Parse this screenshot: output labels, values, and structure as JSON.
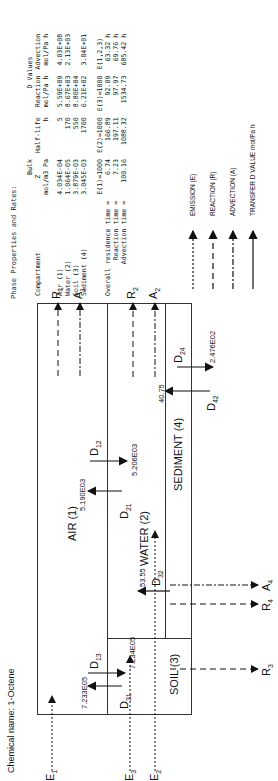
{
  "chemical_name_label": "Chemical name:",
  "chemical_name": "1-Octene",
  "table": {
    "title": "Phase Properties and Rates:",
    "header_row1": [
      "",
      "Bulk",
      "",
      "D Values",
      ""
    ],
    "header_row2": [
      "Compartment",
      "Z",
      "Half-life",
      "Reaction",
      "Advection"
    ],
    "header_row3": [
      "",
      "mol/m3 Pa",
      "h",
      "mol/Pa h",
      "mol/Pa h"
    ],
    "rows": [
      {
        "compartment": "Air (1)",
        "z": "4.034E-04",
        "half_life": "5",
        "reaction": "5.59E+09",
        "advection": "4.03E+08"
      },
      {
        "compartment": "Water (2)",
        "z": "1.064E-05",
        "half_life": "170",
        "reaction": "8.67E+03",
        "advection": "2.13E+03"
      },
      {
        "compartment": "Soil (3)",
        "z": "3.879E-03",
        "half_life": "550",
        "reaction": "8.80E+04",
        "advection": ""
      },
      {
        "compartment": "Sediment (4)",
        "z": "3.045E-03",
        "half_life": "1700",
        "reaction": "6.21E+02",
        "advection": "3.04E+01"
      }
    ],
    "residence_header": [
      "",
      "E(1)=1000",
      "E(2)=1000",
      "E(3)=1000",
      "E(1,2,3)"
    ],
    "residence_rows": [
      {
        "label": "Overall residence time =",
        "e1": "6.74",
        "e2": "166.89",
        "e3": "92.09",
        "e123": "63.32 h"
      },
      {
        "label": "Reaction time =",
        "e1": "7.23",
        "e2": "197.11",
        "e3": "97.97",
        "e123": "69.76 h"
      },
      {
        "label": "Advection time =",
        "e1": "100.16",
        "e2": "1088.32",
        "e3": "1534.73",
        "e123": "685.42 h"
      }
    ]
  },
  "legend": [
    {
      "label": "EMISSION (E)",
      "style": "dotted"
    },
    {
      "label": "REACTION (R)",
      "style": "dashed"
    },
    {
      "label": "ADVECTION (A)",
      "style": "dashdot"
    },
    {
      "label": "TRANSFER D VALUE mol/Pa h",
      "style": "solid"
    }
  ],
  "diagram": {
    "compartments": {
      "air": "AIR (1)",
      "water": "WATER (2)",
      "soil": "SOIL (3)",
      "sediment": "SEDIMENT (4)"
    },
    "emissions": {
      "e1": "E",
      "e1_sub": "1",
      "e2": "E",
      "e2_sub": "2",
      "e3": "E",
      "e3_sub": "3"
    },
    "reactions": {
      "r1": "R",
      "r1_sub": "1",
      "r2": "R",
      "r2_sub": "2",
      "r3": "R",
      "r3_sub": "3",
      "r4": "R",
      "r4_sub": "4"
    },
    "advections": {
      "a1": "A",
      "a1_sub": "1",
      "a2": "A",
      "a2_sub": "2",
      "a4": "A",
      "a4_sub": "4"
    },
    "transfers": {
      "d12": {
        "label": "D",
        "sub": "12",
        "value": "5.206E03"
      },
      "d21": {
        "label": "D",
        "sub": "21",
        "value": "5.190E03"
      },
      "d13": {
        "label": "D",
        "sub": "13",
        "value": "7.234E05"
      },
      "d31": {
        "label": "D",
        "sub": "31",
        "value": "7.233E05"
      },
      "d32": {
        "label": "D",
        "sub": "32",
        "value": "53.55"
      },
      "d24": {
        "label": "D",
        "sub": "24",
        "value": "2.476E02"
      },
      "d42": {
        "label": "D",
        "sub": "42",
        "value": "40.75"
      }
    }
  }
}
